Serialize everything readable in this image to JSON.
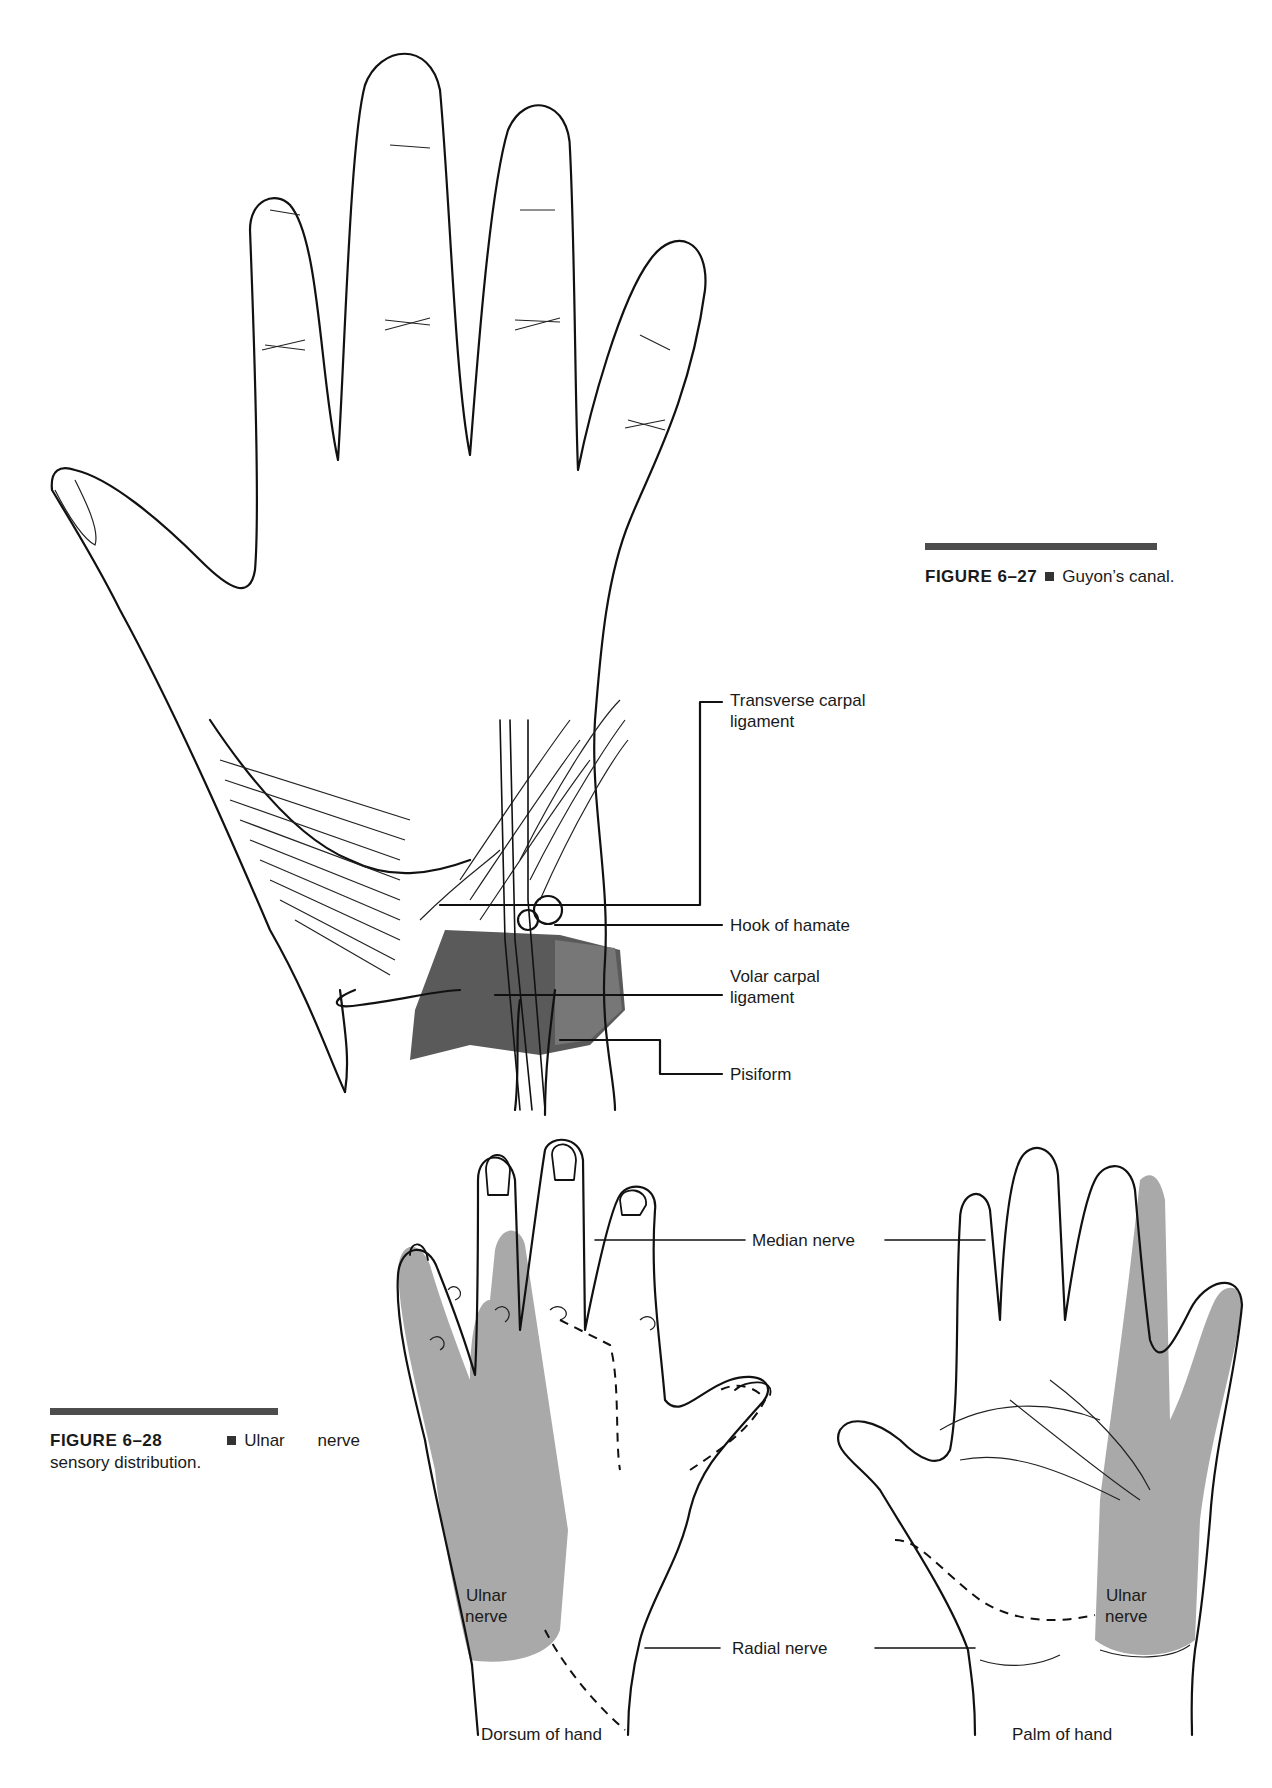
{
  "figure_27": {
    "number": "FIGURE 6–27",
    "title": "Guyon’s canal.",
    "labels": {
      "transverse_carpal_ligament_1": "Transverse carpal",
      "transverse_carpal_ligament_2": "ligament",
      "hook_of_hamate": "Hook of hamate",
      "volar_carpal_ligament_1": "Volar carpal",
      "volar_carpal_ligament_2": "ligament",
      "pisiform": "Pisiform"
    }
  },
  "figure_28": {
    "number": "FIGURE 6–28",
    "title_line1": "Ulnar nerve",
    "title_line2": "sensory distribution.",
    "labels": {
      "median_nerve": "Median nerve",
      "radial_nerve": "Radial nerve",
      "ulnar_nerve_dorsum_1": "Ulnar",
      "ulnar_nerve_dorsum_2": "nerve",
      "ulnar_nerve_palm_1": "Ulnar",
      "ulnar_nerve_palm_2": "nerve",
      "dorsum_of_hand": "Dorsum of hand",
      "palm_of_hand": "Palm of hand"
    }
  },
  "colors": {
    "ink": "#111111",
    "ulnar_shade": "#a9a9a9",
    "ligament_shade": "#5a5a5a",
    "caption_bar": "#4d4d4d"
  }
}
